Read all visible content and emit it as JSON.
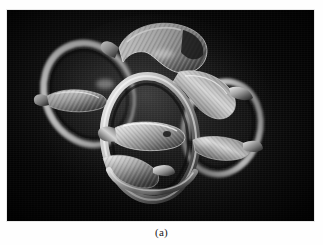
{
  "figure": {
    "caption": "(a)",
    "panel_background_color": "#060606",
    "page_background_color": "#ffffff",
    "image_kind": "photograph",
    "highlight_color": "#d8d8d8",
    "midtone_color": "#8e8e8e",
    "shadow_color": "#2a2a2a",
    "panel": {
      "x": 7,
      "y": 10,
      "width": 307,
      "height": 211
    },
    "elements": {
      "ring_upper_left": "ring-upper-left",
      "ring_right": "ring-right",
      "ring_front_center": "ring-front-center",
      "fish_top": "fish-top",
      "fish_upper_right": "fish-upper-right",
      "fish_center": "fish-center",
      "fish_lower_left": "fish-lower-left"
    }
  }
}
